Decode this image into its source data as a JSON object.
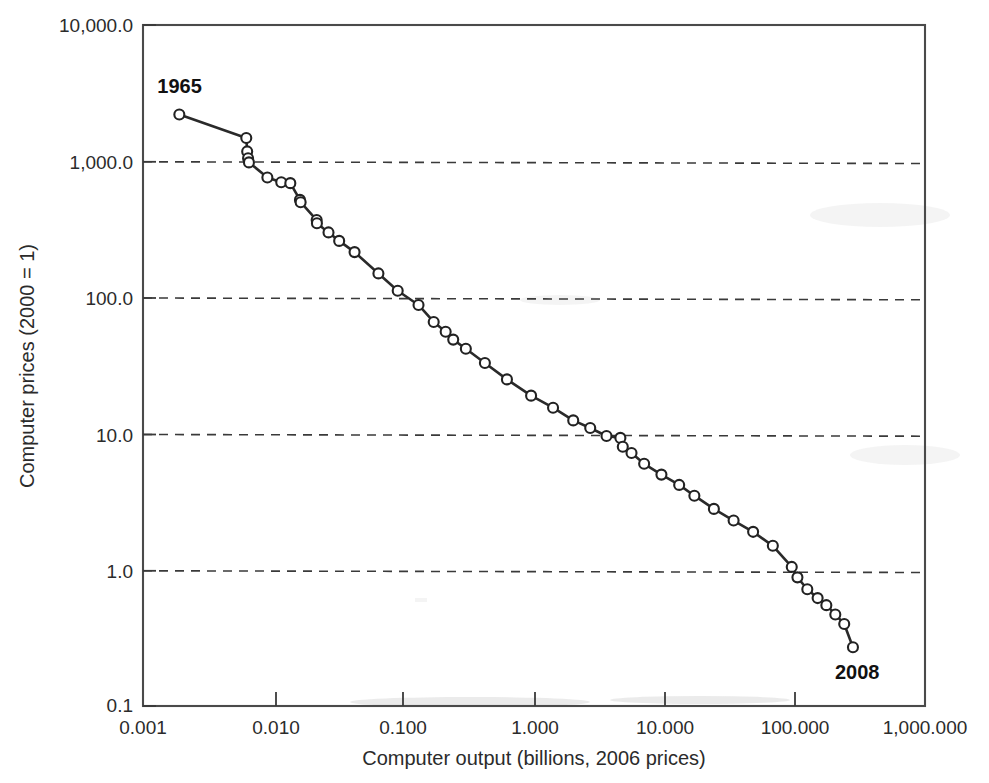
{
  "figure": {
    "background_color": "#ffffff",
    "ink_color": "#2a2a2a",
    "plot_frame": {
      "left": 143,
      "top": 25,
      "right": 925,
      "bottom": 706
    }
  },
  "chart_data": {
    "type": "line",
    "title": "",
    "subtitle": "",
    "xlabel": "Computer output (billions, 2006 prices)",
    "ylabel": "Computer prices (2000 = 1)",
    "xscale": "log",
    "yscale": "log",
    "xlim": [
      0.001,
      1000.0
    ],
    "ylim": [
      0.1,
      10000.0
    ],
    "grid": "horizontal-dashed",
    "legend": "none",
    "xticks": [
      0.001,
      0.01,
      0.1,
      1.0,
      10.0,
      100.0,
      1000.0
    ],
    "xtick_labels": [
      "0.001",
      "0.010",
      "0.100",
      "1.000",
      "10.000",
      "100.000",
      "1,000.000"
    ],
    "yticks": [
      0.1,
      1.0,
      10.0,
      100.0,
      1000.0,
      10000.0
    ],
    "ytick_labels": [
      "0.1",
      "1.0",
      "10.0",
      "100.0",
      "1,000.0",
      "10,000.0"
    ],
    "gridline_values": [
      1.0,
      10.0,
      100.0,
      1000.0
    ],
    "annotations": [
      {
        "text": "1965",
        "x": 0.0019,
        "y": 2200.0,
        "anchor": "above-left"
      },
      {
        "text": "2008",
        "x": 280.0,
        "y": 0.27,
        "anchor": "below-left"
      }
    ],
    "series": [
      {
        "name": "Computer prices vs output",
        "marker": "open-circle",
        "x": [
          0.0019,
          0.0062,
          0.0063,
          0.0064,
          0.0065,
          0.009,
          0.0115,
          0.0135,
          0.016,
          0.0162,
          0.0215,
          0.0216,
          0.0265,
          0.032,
          0.042,
          0.064,
          0.09,
          0.13,
          0.17,
          0.21,
          0.24,
          0.3,
          0.42,
          0.62,
          0.95,
          1.4,
          2.0,
          2.7,
          3.6,
          4.6,
          4.8,
          5.6,
          7.0,
          9.5,
          13.0,
          17.0,
          24.0,
          34.0,
          48.0,
          68.0,
          95.0,
          105.0,
          125.0,
          150.0,
          175.0,
          205.0,
          240.0,
          280.0
        ],
        "y": [
          2200.0,
          1480.0,
          1180.0,
          1050.0,
          980.0,
          760.0,
          700.0,
          690.0,
          520.0,
          500.0,
          370.0,
          350.0,
          300.0,
          260.0,
          215.0,
          150.0,
          112.0,
          88.0,
          66.0,
          56.0,
          49.0,
          42.0,
          33.0,
          25.0,
          19.0,
          15.5,
          12.5,
          11.0,
          9.6,
          9.3,
          8.0,
          7.2,
          6.0,
          5.0,
          4.2,
          3.5,
          2.8,
          2.3,
          1.9,
          1.5,
          1.05,
          0.88,
          0.72,
          0.62,
          0.55,
          0.47,
          0.4,
          0.27
        ]
      }
    ]
  }
}
